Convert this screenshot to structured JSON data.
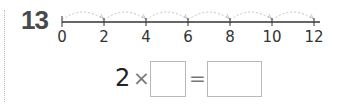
{
  "problem": {
    "number": "13",
    "number_line": {
      "ticks": [
        "0",
        "2",
        "4",
        "6",
        "8",
        "10",
        "12"
      ],
      "jump_size": 2,
      "jumps": 6
    },
    "equation": {
      "multiplicand": "2",
      "times_symbol": "×",
      "equals_symbol": "=",
      "blank_factor": "",
      "blank_product": ""
    }
  },
  "colors": {
    "line": "#333333",
    "arc": "#c4c4c4",
    "box_border": "#b8b8b8",
    "number": "#4a4a4a"
  }
}
